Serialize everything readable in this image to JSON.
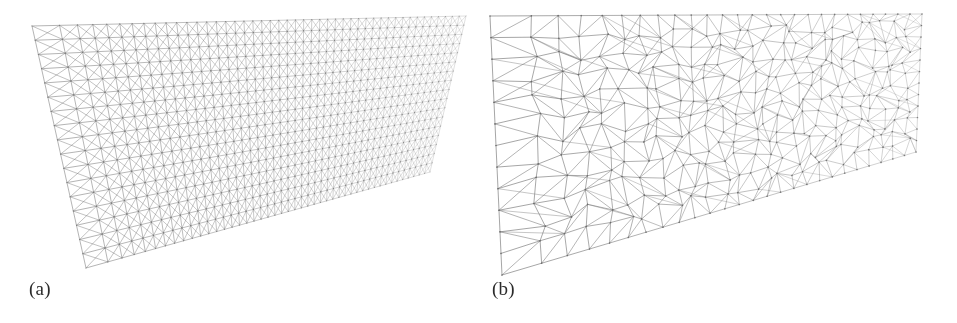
{
  "figure": {
    "background_color": "#ffffff",
    "line_color": "#8a8a8a",
    "label_color": "#2b2b2b",
    "panels": [
      {
        "id": "panel-a",
        "label": "(a)",
        "mesh_type": "structured",
        "description": "structured quadrilateral grid with diagonals, perspective view of a tapering wedge domain"
      },
      {
        "id": "panel-b",
        "label": "(b)",
        "mesh_type": "unstructured",
        "description": "unstructured triangular mesh, perspective view of a tapering wedge domain"
      }
    ]
  },
  "chart_data": {
    "type": "diagram",
    "title": "",
    "subtitle": "",
    "xlabel": "",
    "ylabel": "",
    "legend": [],
    "annotations": [
      "(a)",
      "(b)"
    ],
    "panels": [
      {
        "name": "(a)",
        "mesh": "structured",
        "stroke": "#8a8a8a",
        "u_divisions": 46,
        "v_divisions": 17,
        "diagonals": "both",
        "jitter": 0.0,
        "line_width": 0.55,
        "domain_quad": [
          [
            32,
            26
          ],
          [
            466,
            16
          ],
          [
            430,
            172
          ],
          [
            86,
            268
          ]
        ]
      },
      {
        "name": "(b)",
        "mesh": "unstructured",
        "stroke": "#8a8a8a",
        "u_divisions": 26,
        "v_divisions": 12,
        "diagonals": "random",
        "jitter": 0.34,
        "line_width": 0.7,
        "domain_quad": [
          [
            12,
            16
          ],
          [
            444,
            14
          ],
          [
            438,
            152
          ],
          [
            24,
            275
          ]
        ]
      }
    ]
  }
}
